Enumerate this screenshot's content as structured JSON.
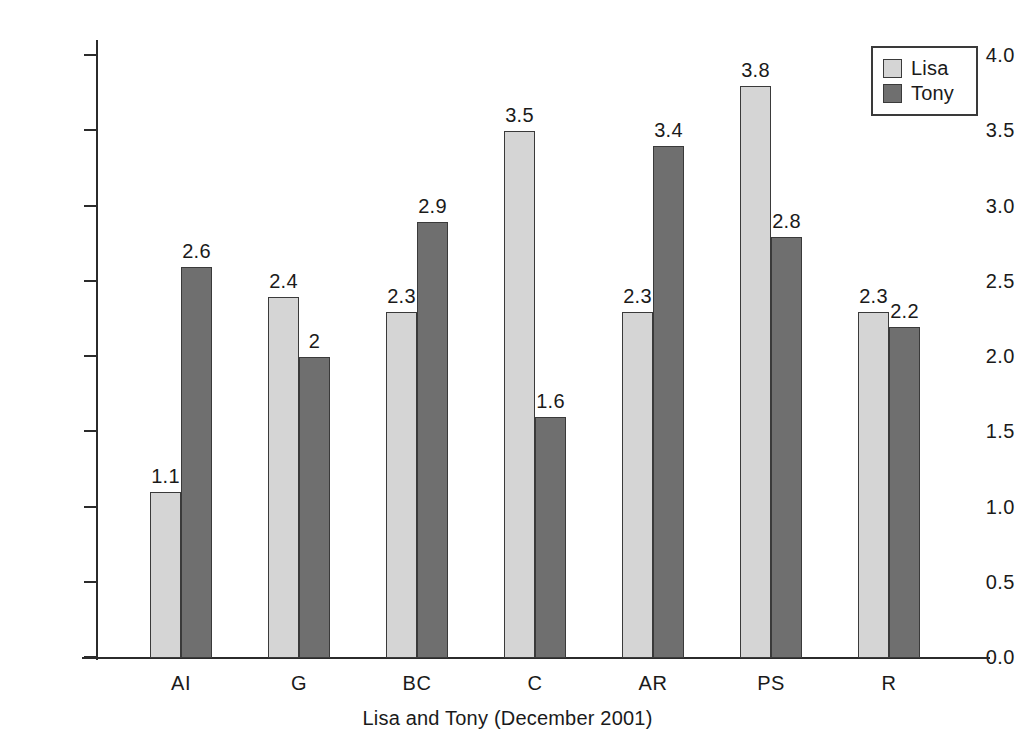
{
  "chart_data": {
    "type": "bar",
    "title": "",
    "xlabel": "Lisa and Tony (December 2001)",
    "ylabel": "",
    "categories": [
      "AI",
      "G",
      "BC",
      "C",
      "AR",
      "PS",
      "R"
    ],
    "series": [
      {
        "name": "Lisa",
        "color": "#d5d5d5",
        "values": [
          1.1,
          2.4,
          2.3,
          3.5,
          2.3,
          3.8,
          2.3
        ],
        "labels": [
          "1.1",
          "2.4",
          "2.3",
          "3.5",
          "2.3",
          "3.8",
          "2.3"
        ]
      },
      {
        "name": "Tony",
        "color": "#6f6f6f",
        "values": [
          2.6,
          2.0,
          2.9,
          1.6,
          3.4,
          2.8,
          2.2
        ],
        "labels": [
          "2.6",
          "2",
          "2.9",
          "1.6",
          "3.4",
          "2.8",
          "2.2"
        ]
      }
    ],
    "ylim": [
      0.0,
      4.0
    ],
    "yticks": [
      0.0,
      0.5,
      1.0,
      1.5,
      2.0,
      2.5,
      3.0,
      3.5,
      4.0
    ],
    "ytick_labels": [
      "0.0",
      "0.5",
      "1.0",
      "1.5",
      "2.0",
      "2.5",
      "3.0",
      "3.5",
      "4.0"
    ],
    "grid": false,
    "legend_position": "top-right",
    "legend_entries": [
      "Lisa",
      "Tony"
    ]
  },
  "axis_title": "Lisa and Tony (December 2001)",
  "legend": {
    "lisa_label": "Lisa",
    "tony_label": "Tony"
  }
}
